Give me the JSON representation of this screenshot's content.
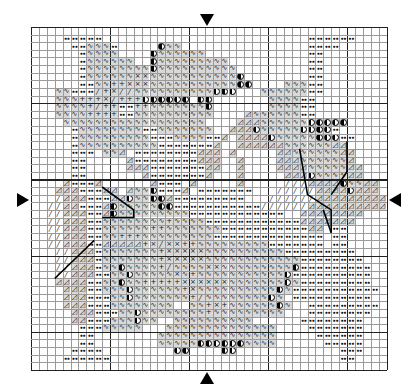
{
  "chart_meta": {
    "title": "Cross-stitch pattern chart",
    "cols": 45,
    "rows": 45,
    "major_every": 10,
    "center_markers": [
      "top",
      "bottom",
      "left",
      "right"
    ]
  },
  "legend_symbols": {
    ".": "empty",
    "d": "dots",
    "w": "wave",
    "+": "plus",
    "x": "cross",
    "/": "slash-shaded",
    "t": "triangle",
    "h": "half-circle",
    "s": "slash"
  },
  "colors": {
    "grid_minor": "#9a9a9a",
    "grid_major": "#222222",
    "shade": "#d9d9d9",
    "ink": "#111111"
  },
  "grid": [
    ".............................................",
    "....ddddd..........................dddddd....",
    ".....ddwwwd.....hww................dddd......",
    "......dwwww....hwwwwww.............dd........",
    "......dwwwwww..hwwwwwwwww..........dd........",
    "......dwwwwwwwwhwwwwwwwwww.........dd........",
    "......dwwwwwwxxwwwwwwwwwwwh........dd........",
    "......ddww++xxxwwwwwwwwwwwhh....wwwdd........",
    "...wwddd/+x//wwwwwwwwwwhhh...wwwwwwdd........",
    "...www+++x/+++hhhhhh.hh.......wwwwdd.........",
    "...wwww+/++dd++wwwwwwwh.......wwwwdd.........",
    "...wwww++++ddwwwwwwwwww....twwwwwwdd.........",
    "....wwwwwwwwwwwwwwwwww....tttwwwwwwhhhhh.....",
    ".....dwwwwwwwwddwwwwwww..ttthwwwwwhhhhd......",
    ".....dwwwwwwwwwdddwwwwddt.tttthwwwwwhhhdd....",
    ".....dwwwwwwwwwwdddddddt..ttttttwwwwwwtt.....",
    ".....ddd.wwt.ddddddddttt.t.....ttwwwwwwtt....",
    ".....dd.....tddddddddttt..t....tttwwwwwwt....",
    ".....dd.....tttdddddddtt..t....ttttwwwwwtt...",
    ".....dd.......tdddddddt...t.....ttthwwwwtt...",
    "....tdddt......tddd.t.....t.....ssstttthwwtt.",
    "...tttdddtt.twwhdddt.ddddddd...ssssstttthttt.",
    "...stttdddtthwwhhtddddddddd...ssssssttttttttt",
    "..ssttdddthwwwwwhhdddddddddddsssssstttttttttt",
    "..sstttddthwwwwwwwwwdddddddddddd..tttttttt...",
    "..sstttddwwwwwwww+wwwwddddddddddddttttttt....",
    "..sstttddwwwwww++wwwwwwwdddddddddddtt.dd.....",
    "..sstttddww+++wwwwwwwwwdddddddddddddd.dd.....",
    "..sstttddttttt+x/xx++wwwwwwwwwddddddd.dd.....",
    "...sstttdwwwwwww+xxxxxwwwwwwwwwwddddddddd....",
    "...sstttdwwwwwww+xxxxxwwwwwwwwwwwwdddddddd...",
    "...sstttdwwhwwww+/wwwwxxwwwwwwwwwhddddddddd..",
    "...sstttddwwhwwwwwxw+wwwwwwwwwwwhdddddddddd..",
    "...ttttddwwhww+++++xxxxxxwwwwwwwhwddddddddd..",
    "....tttddwwwhwwwwww+xwwwwwwwwwwhwddddddddddd.",
    "....tttdddwwhwwwwwww+/wwwwwwwwhw.dddddddddd..",
    "....tttdddwwwwwwww..ww+x+wwwwwwhw..ddddddddd.",
    ".....tttdddwwhwwwwwwww+wwwwwwwww...dddddddd..",
    ".....ttdddwwwhww..wwwwwwwwww......dddddddd...",
    "......dddwwwww...wwwwwwwwwwwwww....ddddddd...",
    "......dd........wwwwwwwwwwwwwww.....dddddd...",
    "......dd........wwwwwhhhhhhwwww......ddddd...",
    ".....dddd.........hh....hh.............ddd...",
    "....dddddd.............................dd....",
    "............................................."
  ],
  "stitch_lines": [
    {
      "points": [
        [
          9,
          21
        ],
        [
          13,
          24
        ],
        [
          13,
          25
        ],
        [
          9,
          25
        ]
      ]
    },
    {
      "points": [
        [
          3,
          33
        ],
        [
          7,
          29
        ],
        [
          8,
          28
        ]
      ]
    },
    {
      "points": [
        [
          34,
          16
        ],
        [
          35,
          22
        ],
        [
          38,
          24
        ],
        [
          38,
          27
        ]
      ]
    },
    {
      "points": [
        [
          40,
          15
        ],
        [
          40,
          19
        ],
        [
          38,
          22
        ]
      ]
    },
    {
      "points": [
        [
          37,
          24
        ],
        [
          38,
          27
        ]
      ]
    }
  ]
}
